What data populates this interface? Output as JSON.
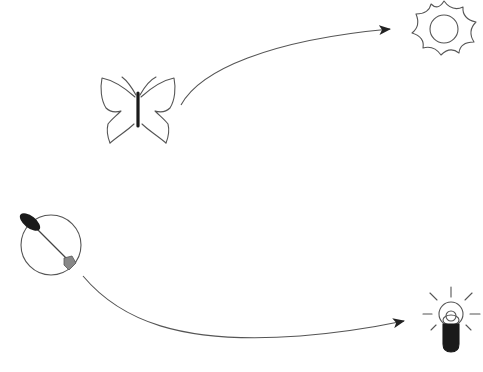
{
  "diagram": {
    "colors": {
      "background": "#ffffff",
      "stroke": "#555555",
      "dark_fill": "#1a1a1a",
      "gray_fill": "#888888"
    },
    "nodes": [
      {
        "id": "butterfly",
        "icon": "butterfly-icon",
        "label": "butterfly"
      },
      {
        "id": "sun",
        "icon": "sun-icon",
        "label": "sun"
      },
      {
        "id": "compass",
        "icon": "compass-needle-icon",
        "label": "circle with needle"
      },
      {
        "id": "bulb",
        "icon": "lightbulb-icon",
        "label": "light bulb"
      }
    ],
    "edges": [
      {
        "from": "butterfly",
        "to": "sun",
        "style": "curved-arrow"
      },
      {
        "from": "compass",
        "to": "bulb",
        "style": "curved-arrow"
      }
    ]
  }
}
